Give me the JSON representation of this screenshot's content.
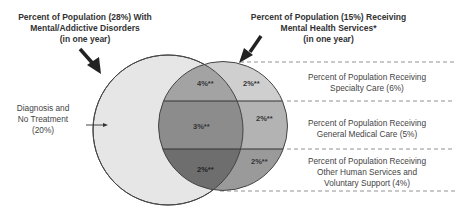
{
  "title_left": {
    "line1": "Percent of Population (28%) With",
    "line2": "Mental/Addictive Disorders",
    "line3": "(in one year)"
  },
  "title_right": {
    "line1": "Percent of Population (15%) Receiving",
    "line2": "Mental Health Services*",
    "line3": "(in one year)"
  },
  "left_label": {
    "line1": "Diagnosis and",
    "line2": "No Treatment",
    "line3": "(20%)"
  },
  "bands": [
    {
      "line1": "Percent of Population Receiving",
      "line2": "Specialty Care (6%)",
      "line3": ""
    },
    {
      "line1": "Percent of Population Receiving",
      "line2": "General Medical Care (5%)",
      "line3": ""
    },
    {
      "line1": "Percent of Population Receiving",
      "line2": "Other Human Services and",
      "line3": "Voluntary Support (4%)"
    }
  ],
  "segments": {
    "overlap_specialty": "4%**",
    "services_only_specialty": "2%**",
    "overlap_general": "3%**",
    "services_only_general": "2%**",
    "overlap_other": "2%**",
    "services_only_other": "2%**"
  },
  "colors": {
    "disorders_circle": "#e6e6e6",
    "specialty_overlap": "#a3a3a3",
    "specialty_only": "#cfcfcf",
    "general_overlap": "#8c8c8c",
    "general_only": "#b3b3b3",
    "other_overlap": "#6e6e6e",
    "other_only": "#9a9a9a",
    "outline": "#444444"
  }
}
